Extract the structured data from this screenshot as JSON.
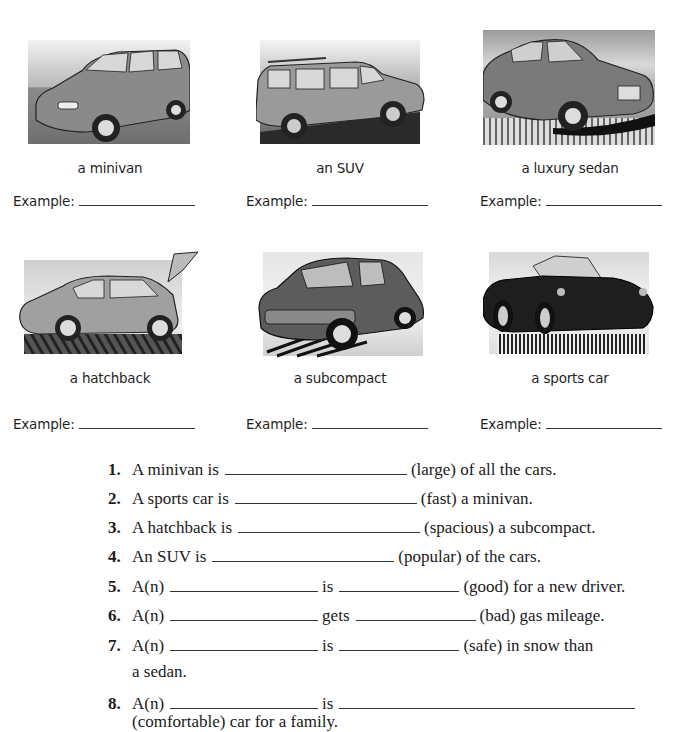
{
  "vehicles": [
    {
      "caption": "a minivan",
      "example_label": "Example:",
      "image": "minivan-illustration",
      "body_color": "#8a8a8a"
    },
    {
      "caption": "an SUV",
      "example_label": "Example:",
      "image": "suv-illustration",
      "body_color": "#9a9a9a"
    },
    {
      "caption": "a luxury sedan",
      "example_label": "Example:",
      "image": "luxury-sedan-illustration",
      "body_color": "#7a7a7a"
    },
    {
      "caption": "a hatchback",
      "example_label": "Example:",
      "image": "hatchback-illustration",
      "body_color": "#a0a0a0"
    },
    {
      "caption": "a subcompact",
      "example_label": "Example:",
      "image": "subcompact-illustration",
      "body_color": "#5c5c5c"
    },
    {
      "caption": "a sports car",
      "example_label": "Example:",
      "image": "sports-car-illustration",
      "body_color": "#1e1e1e"
    }
  ],
  "exercises": [
    {
      "num": "1.",
      "parts": [
        "A minivan is",
        "(large) of all the cars."
      ]
    },
    {
      "num": "2.",
      "parts": [
        "A sports car is",
        "(fast) a minivan."
      ]
    },
    {
      "num": "3.",
      "parts": [
        "A hatchback is",
        "(spacious) a subcompact."
      ]
    },
    {
      "num": "4.",
      "parts": [
        "An SUV is",
        "(popular) of the cars."
      ]
    },
    {
      "num": "5.",
      "parts": [
        "A(n)",
        "is",
        "(good) for a new driver."
      ]
    },
    {
      "num": "6.",
      "parts": [
        "A(n)",
        "gets",
        "(bad) gas mileage."
      ]
    },
    {
      "num": "7.",
      "parts": [
        "A(n)",
        "is",
        "(safe) in snow than"
      ],
      "continuation": "a sedan."
    },
    {
      "num": "8.",
      "parts": [
        "A(n)",
        "is"
      ],
      "continuation": "(comfortable) car for a family."
    }
  ]
}
